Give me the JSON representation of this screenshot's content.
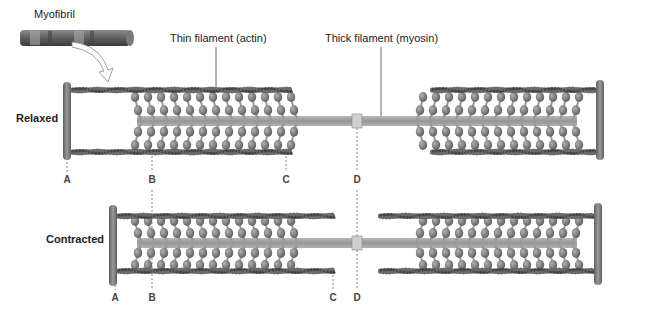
{
  "title_labels": {
    "myofibril": "Myofibril",
    "thin_filament": "Thin filament (actin)",
    "thick_filament": "Thick filament (myosin)"
  },
  "states": {
    "relaxed": "Relaxed",
    "contracted": "Contracted"
  },
  "markers": {
    "relaxed": [
      {
        "letter": "A",
        "x": 67
      },
      {
        "letter": "B",
        "x": 152
      },
      {
        "letter": "C",
        "x": 286
      },
      {
        "letter": "D",
        "x": 357
      }
    ],
    "contracted": [
      {
        "letter": "A",
        "x": 115
      },
      {
        "letter": "B",
        "x": 152
      },
      {
        "letter": "C",
        "x": 333
      },
      {
        "letter": "D",
        "x": 357
      }
    ]
  },
  "colors": {
    "filament": "#5a5a5a",
    "zdisc": "#7a7a7a",
    "myosin_head": "#8a8a8a",
    "thick_body": "#a8a8a8",
    "label": "#222222"
  }
}
